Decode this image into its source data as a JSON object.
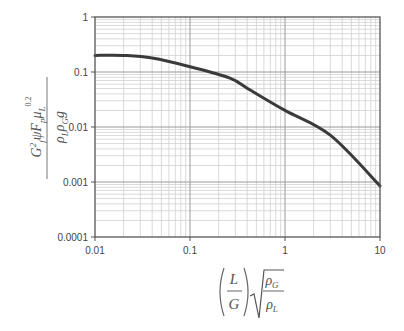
{
  "chart_data": {
    "type": "line",
    "title": "",
    "xlabel": "(L/G)·sqrt(ρG/ρL)",
    "ylabel": "G²f ψ Fp μL^0.2 / (ρL ρG g)",
    "xscale": "log",
    "yscale": "log",
    "xlim": [
      0.01,
      10
    ],
    "ylim": [
      0.0001,
      1
    ],
    "grid": true,
    "legend": "none",
    "x_ticks": [
      "0.01",
      "0.1",
      "1",
      "10"
    ],
    "y_ticks": [
      "1",
      "0.1",
      "0.01",
      "0.001",
      "0.0001"
    ],
    "series": [
      {
        "name": "flooding correlation",
        "x": [
          0.01,
          0.02,
          0.04,
          0.1,
          0.26,
          0.43,
          1,
          3,
          10
        ],
        "y": [
          0.2,
          0.2,
          0.18,
          0.125,
          0.078,
          0.047,
          0.02,
          0.0071,
          0.00085
        ]
      }
    ],
    "colors": {
      "curve": "#3a3a3a",
      "major_grid": "#9a9a9a",
      "minor_grid": "#d0d0d0",
      "frame": "#555555"
    }
  },
  "axes": {
    "x_tick_labels": [
      "0.01",
      "0.1",
      "1",
      "10"
    ],
    "y_tick_labels": [
      "1",
      "0.1",
      "0.01",
      "0.001",
      "0.0001"
    ]
  },
  "ylabel_parts": {
    "numerator": "G²fψFpμL",
    "exponent": "0.2",
    "denominator": "ρLρGg"
  },
  "xlabel_parts": {
    "paren_num": "L",
    "paren_den": "G",
    "sqrt_num": "ρG",
    "sqrt_den": "ρL"
  }
}
